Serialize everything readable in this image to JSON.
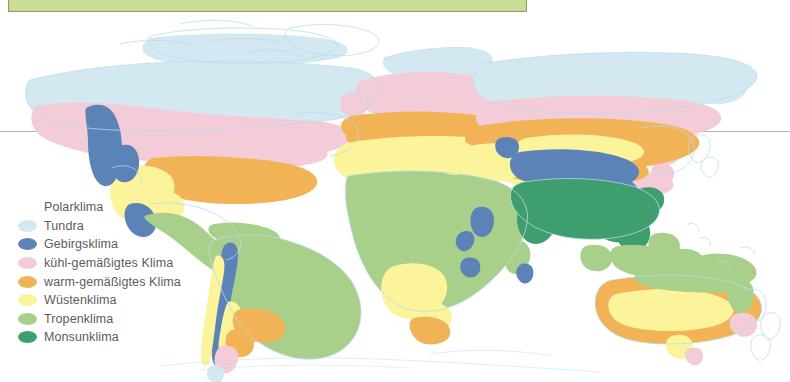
{
  "page": {
    "background_color": "#ffffff",
    "width": 790,
    "height": 382
  },
  "top_banner": {
    "name": "title-banner",
    "fill_color": "#cbdc96",
    "border_color": "#8f9a7a",
    "label": ""
  },
  "reference_line": {
    "name": "equator-reference-line",
    "color": "#9a9a9a",
    "y": 131
  },
  "legend": {
    "title": "",
    "items": [
      {
        "label": "Polarklima",
        "color": "#ffffff",
        "has_swatch": false
      },
      {
        "label": "Tundra",
        "color": "#d4e8f2",
        "has_swatch": true
      },
      {
        "label": "Gebirgsklima",
        "color": "#5c83b8",
        "has_swatch": true
      },
      {
        "label": "kühl-gemäßigtes Klima",
        "color": "#f3ccd8",
        "has_swatch": true
      },
      {
        "label": "warm-gemäßigtes Klima",
        "color": "#f2b357",
        "has_swatch": true
      },
      {
        "label": "Wüstenklima",
        "color": "#fbf49a",
        "has_swatch": true
      },
      {
        "label": "Tropenklima",
        "color": "#a8d08a",
        "has_swatch": true
      },
      {
        "label": "Monsunklima",
        "color": "#3f9e6e",
        "has_swatch": true
      }
    ]
  },
  "map": {
    "name": "world-climate-map",
    "projection_note": "world map, equirectangular-like",
    "coastline_color": "#b9dcee",
    "regions": [
      {
        "name": "north-america",
        "climates": [
          "Tundra",
          "kühl-gemäßigtes Klima",
          "warm-gemäßigtes Klima",
          "Wüstenklima",
          "Gebirgsklima",
          "Tropenklima"
        ]
      },
      {
        "name": "south-america",
        "climates": [
          "Tropenklima",
          "Gebirgsklima",
          "Wüstenklima",
          "warm-gemäßigtes Klima",
          "kühl-gemäßigtes Klima"
        ]
      },
      {
        "name": "europe",
        "climates": [
          "Tundra",
          "kühl-gemäßigtes Klima",
          "warm-gemäßigtes Klima"
        ]
      },
      {
        "name": "africa",
        "climates": [
          "warm-gemäßigtes Klima",
          "Wüstenklima",
          "Tropenklima",
          "Gebirgsklima"
        ]
      },
      {
        "name": "asia",
        "climates": [
          "Tundra",
          "kühl-gemäßigtes Klima",
          "warm-gemäßigtes Klima",
          "Wüstenklima",
          "Gebirgsklima",
          "Monsunklima",
          "Tropenklima"
        ]
      },
      {
        "name": "australia-oceania",
        "climates": [
          "warm-gemäßigtes Klima",
          "Wüstenklima",
          "Tropenklima",
          "kühl-gemäßigtes Klima"
        ]
      }
    ]
  },
  "colors": {
    "tundra": "#d4e8f2",
    "gebirge": "#5c83b8",
    "kuehl": "#f3ccd8",
    "warm": "#f2b357",
    "wueste": "#fbf49a",
    "tropen": "#a8d08a",
    "monsun": "#3f9e6e",
    "coast": "#b9dcee",
    "banner": "#cbdc96"
  }
}
